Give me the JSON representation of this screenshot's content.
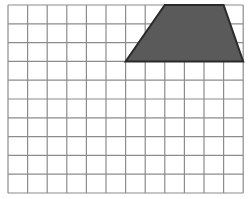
{
  "grid": {
    "origin_x": 8,
    "origin_y": 5,
    "cols": 12,
    "rows": 10,
    "cell_w": 19.6,
    "cell_h": 18.8,
    "line_color": "#8c8c8c",
    "line_width": 1.2,
    "background": "#ffffff"
  },
  "shape": {
    "type": "trapezoid",
    "vertices_grid": [
      [
        8,
        0
      ],
      [
        11,
        0
      ],
      [
        12,
        3
      ],
      [
        6,
        3
      ]
    ],
    "fill": "#5a5a5a",
    "stroke": "#2a2a2a",
    "stroke_width": 2
  }
}
